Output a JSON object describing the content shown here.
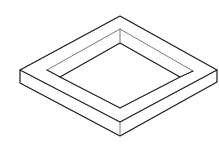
{
  "diagram": {
    "title": "",
    "stroke_color": "#1a1a1a",
    "thin_stroke_color": "#555555",
    "background": "#ffffff"
  }
}
